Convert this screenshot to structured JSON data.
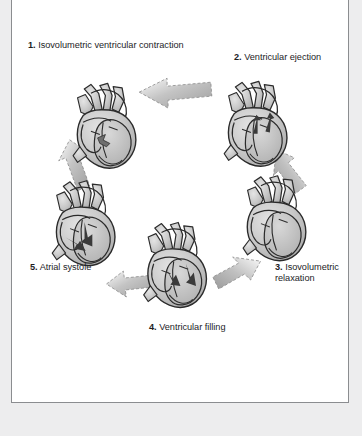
{
  "figure": {
    "kind": "cardiac-cycle-diagram",
    "background_color": "#ffffff",
    "page_margin_color": "#ededee",
    "border_color": "#8b8d90",
    "text_color": "#1d1d1f",
    "heart_fill": "#c9c9c9",
    "heart_outline": "#2b2b2b",
    "arrow_fill": "#b5b5b5"
  },
  "labels": {
    "step1": {
      "number": "1.",
      "text": "Isovolumetric ventricular contraction"
    },
    "step2": {
      "number": "2.",
      "text": "Ventricular ejection"
    },
    "step3": {
      "number": "3.",
      "text": "Isovolumetric relaxation"
    },
    "step4": {
      "number": "4.",
      "text": "Ventricular filling"
    },
    "step5": {
      "number": "5.",
      "text": "Atrial systole"
    }
  },
  "steps": [
    {
      "id": 1,
      "label": "1. Isovolumetric ventricular contraction",
      "position": "top-left"
    },
    {
      "id": 2,
      "label": "2. Ventricular ejection",
      "position": "top-right"
    },
    {
      "id": 3,
      "label": "3. Isovolumetric relaxation",
      "position": "right"
    },
    {
      "id": 4,
      "label": "4. Ventricular filling",
      "position": "bottom"
    },
    {
      "id": 5,
      "label": "5. Atrial systole",
      "position": "left"
    }
  ],
  "cycle": {
    "direction": "clockwise",
    "arrow_count": 5
  }
}
